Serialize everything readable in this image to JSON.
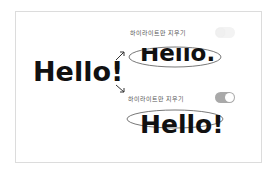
{
  "source_text": "Hello!",
  "option_top": {
    "label": "하이라이트만 지우기",
    "toggle_state": "off"
  },
  "option_bottom": {
    "label": "하이라이트만 지우기",
    "toggle_state": "on"
  },
  "result_top_text": "Hello.",
  "result_bottom_text": "Hello!",
  "colors": {
    "toggle_on": "#a9a9a9",
    "toggle_off": "#f3f3f3",
    "frame_border": "#dcdcdc",
    "text": "#111111"
  }
}
